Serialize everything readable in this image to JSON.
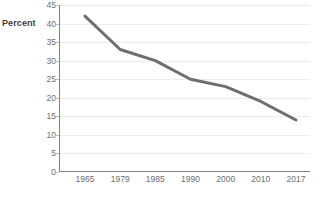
{
  "chart_data": {
    "type": "line",
    "title": "",
    "subtitle": "",
    "xlabel": "",
    "ylabel": "Percent",
    "categories": [
      "1965",
      "1979",
      "1985",
      "1990",
      "2000",
      "2010",
      "2017"
    ],
    "values": [
      42,
      33,
      30,
      25,
      23,
      19,
      14
    ],
    "series": [
      {
        "name": "Percent",
        "values": [
          42,
          33,
          30,
          25,
          23,
          19,
          14
        ]
      }
    ],
    "ylim": [
      0,
      45
    ],
    "ytick_labels": [
      "0",
      "5",
      "10",
      "15",
      "20",
      "25",
      "30",
      "35",
      "40",
      "45"
    ],
    "ytick_values": [
      0,
      5,
      10,
      15,
      20,
      25,
      30,
      35,
      40,
      45
    ],
    "xtick_labels": [
      "1965",
      "1979",
      "1985",
      "1990",
      "2000",
      "2010",
      "2017"
    ],
    "grid": true,
    "grid_axis": "y",
    "legend": false,
    "legend_position": "none",
    "markers": false,
    "annotations": [],
    "colors": {
      "line": "#6d6e71",
      "gridline": "#ececed",
      "axis": "#808285",
      "tick_text": "#6d6e71",
      "axis_title_text": "#414042",
      "background": "#ffffff"
    }
  }
}
